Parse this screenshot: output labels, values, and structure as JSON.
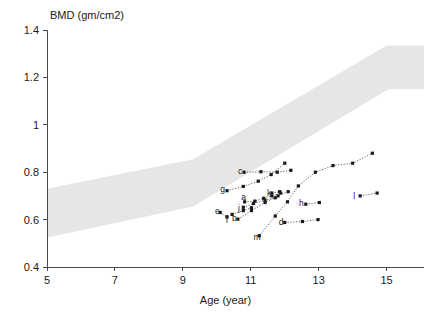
{
  "chart_data": {
    "type": "scatter",
    "title": "BMD (gm/cm2)",
    "xlabel": "Age (year)",
    "ylabel": "BMD (gm/cm2)",
    "xlim": [
      5,
      16.1
    ],
    "ylim": [
      0.4,
      1.4
    ],
    "grid": false,
    "legend": "none",
    "xticks": [
      5,
      7,
      9,
      11,
      13,
      15
    ],
    "xtick_labels": [
      "5",
      "7",
      "9",
      "11",
      "13",
      "15"
    ],
    "yticks": [
      0.4,
      0.6,
      0.8,
      1.0,
      1.2,
      1.4
    ],
    "ytick_labels": [
      "0.4",
      "0.6",
      "0.8",
      "1",
      "1.2",
      "1.4"
    ],
    "reference_band": {
      "name": "normal-reference-range",
      "color": "#e6e6e6",
      "upper": [
        [
          5,
          0.73
        ],
        [
          9.3,
          0.855
        ],
        [
          15.0,
          1.335
        ],
        [
          16.1,
          1.335
        ]
      ],
      "lower": [
        [
          5,
          0.525
        ],
        [
          9.3,
          0.655
        ],
        [
          15.05,
          1.15
        ],
        [
          16.1,
          1.15
        ]
      ]
    },
    "series": [
      {
        "name": "a",
        "label": "a",
        "label_x": 10.72,
        "label_y": 0.695,
        "points": [
          [
            10.82,
            0.675
          ],
          [
            11.12,
            0.678
          ],
          [
            11.38,
            0.69
          ],
          [
            11.62,
            0.7
          ],
          [
            11.88,
            0.712
          ]
        ]
      },
      {
        "name": "b",
        "label": "b",
        "label_x": 10.45,
        "label_y": 0.608,
        "points": [
          [
            10.62,
            0.602
          ],
          [
            11.02,
            0.638
          ],
          [
            11.42,
            0.672
          ],
          [
            11.8,
            0.7
          ],
          [
            12.1,
            0.718
          ]
        ]
      },
      {
        "name": "c",
        "label": "c",
        "label_x": 10.62,
        "label_y": 0.805,
        "points": [
          [
            10.8,
            0.8
          ],
          [
            11.3,
            0.802
          ],
          [
            11.78,
            0.8
          ],
          [
            12.18,
            0.808
          ]
        ]
      },
      {
        "name": "d",
        "label": "d",
        "label_x": 11.82,
        "label_y": 0.588,
        "points": [
          [
            12.0,
            0.588
          ],
          [
            12.52,
            0.592
          ],
          [
            12.98,
            0.6
          ]
        ]
      },
      {
        "name": "e",
        "label": "e",
        "label_x": 9.95,
        "label_y": 0.635,
        "points": [
          [
            10.1,
            0.63
          ],
          [
            10.3,
            0.612
          ]
        ]
      },
      {
        "name": "f",
        "label": "f",
        "label_x": 10.26,
        "label_y": 0.598,
        "points": [
          [
            10.45,
            0.622
          ],
          [
            10.78,
            0.638
          ],
          [
            11.02,
            0.65
          ]
        ]
      },
      {
        "name": "g",
        "label": "g",
        "label_x": 10.1,
        "label_y": 0.728,
        "points": [
          [
            10.3,
            0.722
          ],
          [
            10.78,
            0.74
          ],
          [
            11.22,
            0.762
          ],
          [
            11.6,
            0.79
          ],
          [
            12.0,
            0.838
          ]
        ]
      },
      {
        "name": "h",
        "label": "h",
        "label_x": 12.42,
        "label_y": 0.668,
        "points": [
          [
            12.62,
            0.665
          ],
          [
            13.02,
            0.672
          ]
        ]
      },
      {
        "name": "j",
        "label": "j",
        "label_x": 10.62,
        "label_y": 0.648,
        "points": [
          [
            10.78,
            0.652
          ],
          [
            11.08,
            0.668
          ],
          [
            11.42,
            0.682
          ],
          [
            11.72,
            0.692
          ]
        ]
      },
      {
        "name": "k",
        "label": "k",
        "label_x": 11.48,
        "label_y": 0.712,
        "points": [
          [
            11.62,
            0.712
          ],
          [
            11.85,
            0.718
          ]
        ]
      },
      {
        "name": "l",
        "label": "l",
        "label_x": 14.02,
        "label_y": 0.7,
        "points": [
          [
            14.22,
            0.7
          ],
          [
            14.72,
            0.712
          ]
        ]
      },
      {
        "name": "m",
        "label": "m",
        "label_x": 11.08,
        "label_y": 0.528,
        "points": [
          [
            11.25,
            0.532
          ],
          [
            11.72,
            0.615
          ],
          [
            12.08,
            0.675
          ],
          [
            12.4,
            0.742
          ],
          [
            12.9,
            0.8
          ],
          [
            13.42,
            0.828
          ],
          [
            14.0,
            0.838
          ],
          [
            14.58,
            0.88
          ]
        ]
      }
    ]
  }
}
